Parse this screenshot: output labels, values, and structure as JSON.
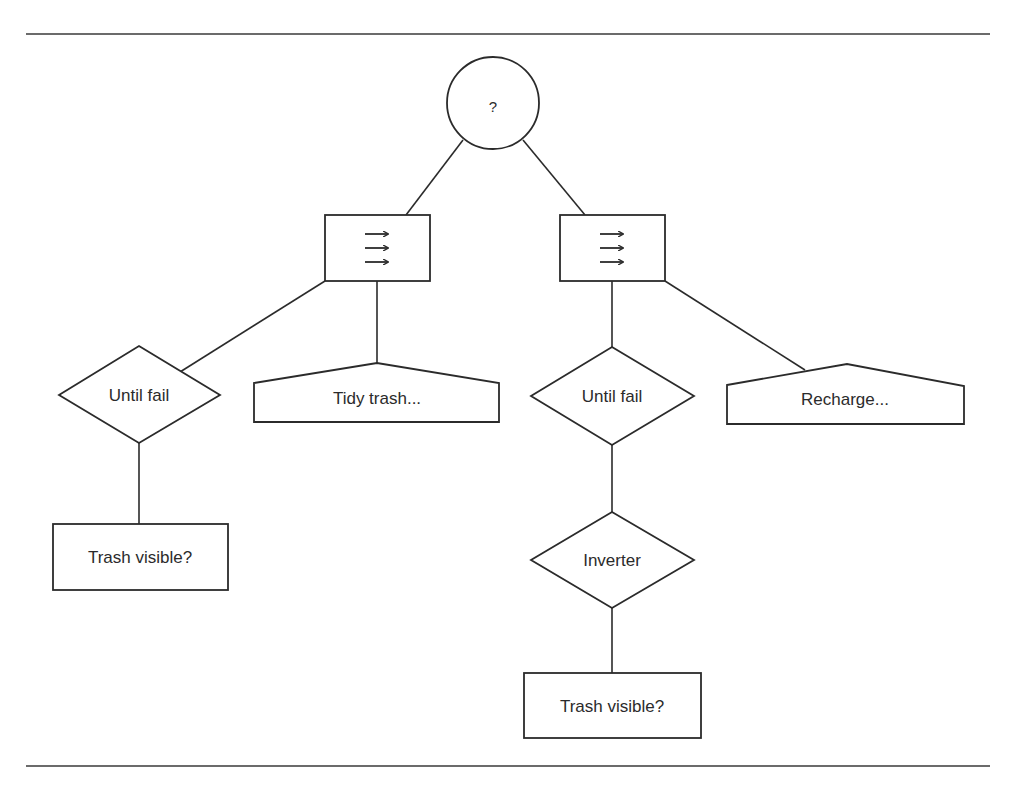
{
  "diagram": {
    "type": "behaviour-tree",
    "colors": {
      "stroke": "#2b2b2b",
      "background": "#ffffff"
    },
    "root": {
      "id": "selector",
      "kind": "selector",
      "symbol": "?"
    },
    "nodes": {
      "seq_left": {
        "kind": "sequence",
        "symbol": "→→→"
      },
      "seq_right": {
        "kind": "sequence",
        "symbol": "→→→"
      },
      "until_fail_left": {
        "kind": "decorator",
        "label": "Until fail"
      },
      "tidy_trash": {
        "kind": "action",
        "label": "Tidy trash..."
      },
      "trash_visible_left": {
        "kind": "condition",
        "label": "Trash visible?"
      },
      "until_fail_right": {
        "kind": "decorator",
        "label": "Until fail"
      },
      "recharge": {
        "kind": "action",
        "label": "Recharge..."
      },
      "inverter": {
        "kind": "decorator",
        "label": "Inverter"
      },
      "trash_visible_right": {
        "kind": "condition",
        "label": "Trash visible?"
      }
    },
    "edges": [
      [
        "selector",
        "seq_left"
      ],
      [
        "selector",
        "seq_right"
      ],
      [
        "seq_left",
        "until_fail_left"
      ],
      [
        "seq_left",
        "tidy_trash"
      ],
      [
        "until_fail_left",
        "trash_visible_left"
      ],
      [
        "seq_right",
        "until_fail_right"
      ],
      [
        "seq_right",
        "recharge"
      ],
      [
        "until_fail_right",
        "inverter"
      ],
      [
        "inverter",
        "trash_visible_right"
      ]
    ]
  }
}
